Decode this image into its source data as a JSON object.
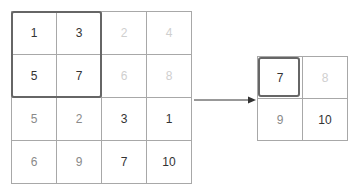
{
  "input_grid": {
    "rows": [
      [
        {
          "v": "1",
          "s": "dark"
        },
        {
          "v": "3",
          "s": "dark"
        },
        {
          "v": "2",
          "s": "faint"
        },
        {
          "v": "4",
          "s": "faint"
        }
      ],
      [
        {
          "v": "5",
          "s": "dark"
        },
        {
          "v": "7",
          "s": "dark"
        },
        {
          "v": "6",
          "s": "faint"
        },
        {
          "v": "8",
          "s": "faint"
        }
      ],
      [
        {
          "v": "5",
          "s": "mid"
        },
        {
          "v": "2",
          "s": "mid"
        },
        {
          "v": "3",
          "s": "dark"
        },
        {
          "v": "1",
          "s": "dark"
        }
      ],
      [
        {
          "v": "6",
          "s": "mid"
        },
        {
          "v": "9",
          "s": "mid"
        },
        {
          "v": "7",
          "s": "dark"
        },
        {
          "v": "10",
          "s": "dark"
        }
      ]
    ],
    "highlight_window": {
      "rows": [
        0,
        1
      ],
      "cols": [
        0,
        1
      ]
    }
  },
  "output_grid": {
    "rows": [
      [
        {
          "v": "7",
          "s": "dark"
        },
        {
          "v": "8",
          "s": "faint"
        }
      ],
      [
        {
          "v": "9",
          "s": "mid"
        },
        {
          "v": "10",
          "s": "dark"
        }
      ]
    ],
    "highlight_cell": {
      "row": 0,
      "col": 0
    }
  },
  "colors": {
    "border": "#a8a8a8",
    "highlight": "#666666",
    "arrow": "#333333"
  }
}
